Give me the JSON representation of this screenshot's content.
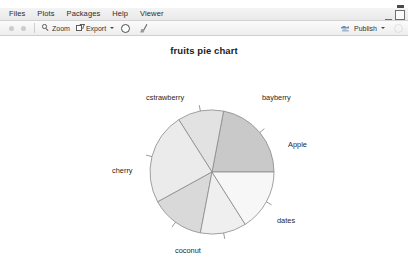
{
  "window": {
    "minimize_label": "minimize",
    "maximize_label": "maximize"
  },
  "menubar": {
    "items": [
      {
        "label": "Files"
      },
      {
        "label": "Plots"
      },
      {
        "label": "Packages"
      },
      {
        "label": "Help"
      },
      {
        "label": "Viewer"
      }
    ]
  },
  "toolbar": {
    "back_label": "",
    "forward_label": "",
    "zoom_label": "Zoom",
    "export_label": "Export",
    "clear_label": "",
    "broom_label": "",
    "publish_label": "Publish"
  },
  "chart_data": {
    "type": "pie",
    "title": "fruits pie chart",
    "xlabel": "",
    "ylabel": "",
    "legend": "none",
    "grid": false,
    "start_angle_deg": 0,
    "direction": "counterclockwise",
    "categories": [
      "bayberry",
      "cstrawberry",
      "cherry",
      "coconut",
      "dates",
      "Apple"
    ],
    "values": [
      22,
      12,
      24,
      14,
      12,
      16
    ],
    "labels": [
      "bayberry",
      "cstrawberry",
      "cherry",
      "coconut",
      "dates",
      "Apple"
    ],
    "colors": [
      "#c9c9c9",
      "#e2e2e2",
      "#ebebeb",
      "#d9d9d9",
      "#efefef",
      "#f7f7f7"
    ],
    "border_color": "#8a8a8a"
  }
}
